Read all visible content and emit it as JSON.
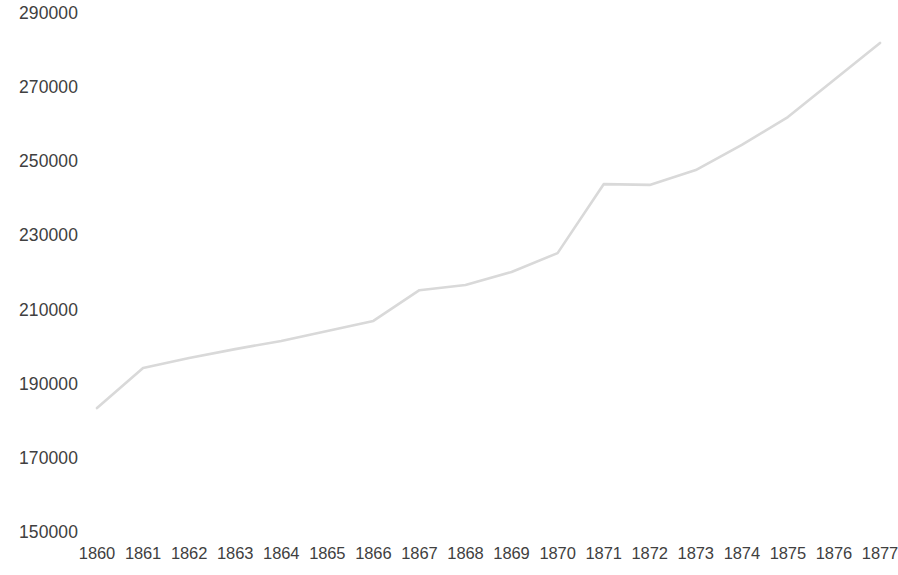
{
  "chart_data": {
    "type": "line",
    "title": "",
    "subtitle": "",
    "xlabel": "",
    "ylabel": "",
    "grid": false,
    "legend": false,
    "legend_position": "none",
    "categories": [
      "1860",
      "1861",
      "1862",
      "1863",
      "1864",
      "1865",
      "1866",
      "1867",
      "1868",
      "1869",
      "1870",
      "1871",
      "1872",
      "1873",
      "1874",
      "1875",
      "1876",
      "1877"
    ],
    "values": [
      183700,
      194500,
      197200,
      199600,
      201800,
      204500,
      207200,
      215500,
      216900,
      220400,
      225500,
      244100,
      243900,
      247900,
      254700,
      262200,
      272200,
      282200
    ],
    "series": [
      {
        "name": "",
        "color": "#d9d9d9",
        "values": [
          183700,
          194500,
          197200,
          199600,
          201800,
          204500,
          207200,
          215500,
          216900,
          220400,
          225500,
          244100,
          243900,
          247900,
          254700,
          262200,
          272200,
          282200
        ]
      }
    ],
    "ylim": [
      150000,
      290000
    ],
    "ytick_step": 20000,
    "ytick_labels": [
      "290000",
      "270000",
      "250000",
      "230000",
      "210000",
      "190000",
      "170000",
      "150000"
    ],
    "ytick_values": [
      290000,
      270000,
      250000,
      230000,
      210000,
      190000,
      170000,
      150000
    ],
    "xtick_labels": [
      "1860",
      "1861",
      "1862",
      "1863",
      "1864",
      "1865",
      "1866",
      "1867",
      "1868",
      "1869",
      "1870",
      "1871",
      "1872",
      "1873",
      "1874",
      "1875",
      "1876",
      "1877"
    ]
  },
  "colors": {
    "line": "#d9d9d9",
    "text": "#404040",
    "background": "#ffffff"
  },
  "layout": {
    "plot_left": 97,
    "plot_right": 880,
    "plot_top": 14,
    "plot_bottom": 533,
    "y_label_right": 78,
    "x_label_y": 545
  }
}
